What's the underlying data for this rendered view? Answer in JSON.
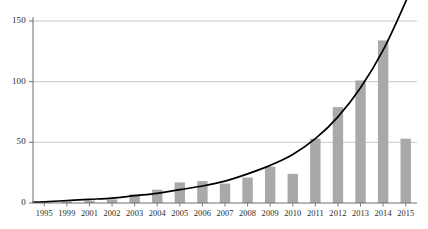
{
  "chart_data": {
    "type": "bar",
    "title": "",
    "subtitle": "",
    "xlabel": "",
    "ylabel": "",
    "categories": [
      "1995",
      "1999",
      "2001",
      "2002",
      "2003",
      "2004",
      "2005",
      "2006",
      "2007",
      "2008",
      "2009",
      "2010",
      "2011",
      "2012",
      "2013",
      "2014",
      "2015"
    ],
    "values": [
      1,
      1,
      2,
      3,
      7,
      11,
      17,
      18,
      16,
      21,
      30,
      24,
      53,
      79,
      101,
      134,
      53
    ],
    "series": [
      {
        "name": "bars",
        "type": "bar",
        "values": [
          1,
          1,
          2,
          3,
          7,
          11,
          17,
          18,
          16,
          21,
          30,
          24,
          53,
          79,
          101,
          134,
          53
        ]
      },
      {
        "name": "trend",
        "type": "line",
        "values": [
          1,
          2,
          3,
          4,
          6,
          8,
          11,
          14,
          18,
          24,
          31,
          40,
          53,
          71,
          95,
          126,
          166
        ]
      }
    ],
    "ylim": [
      0,
      150
    ],
    "yticks": [
      0,
      50,
      100,
      150
    ],
    "yticklabels": [
      "0",
      "50",
      "100",
      "150"
    ],
    "grid": true,
    "grid_axis": "y",
    "legend": "none",
    "bar_color": "#a9a9a9",
    "line_color": "#000000",
    "grid_color": "#b9b9b9",
    "axis_color": "#6e6e6e",
    "background": "#ffffff"
  }
}
